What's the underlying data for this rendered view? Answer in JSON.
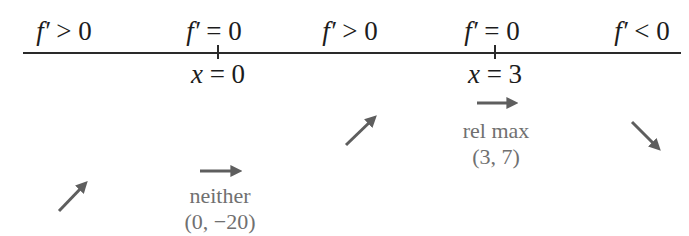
{
  "diagram": {
    "type": "sign-chart",
    "colors": {
      "text": "#1c1c1c",
      "line": "#2a2a2a",
      "arrow": "#5e5e5e",
      "annotation": "#707070"
    },
    "intervals": [
      {
        "sign_text": "f′ > 0",
        "f": "f′",
        "rel": ">",
        "val": "0",
        "arrow": "increasing"
      },
      {
        "sign_text": "f′ = 0",
        "f": "f′",
        "rel": "=",
        "val": "0",
        "arrow": "flat"
      },
      {
        "sign_text": "f′ > 0",
        "f": "f′",
        "rel": ">",
        "val": "0",
        "arrow": "increasing"
      },
      {
        "sign_text": "f′ = 0",
        "f": "f′",
        "rel": "=",
        "val": "0",
        "arrow": "flat"
      },
      {
        "sign_text": "f′ < 0",
        "f": "f′",
        "rel": "<",
        "val": "0",
        "arrow": "decreasing"
      }
    ],
    "critical_points": [
      {
        "var": "x",
        "eq": "=",
        "value": "0",
        "label": "x = 0",
        "classification": "neither",
        "point": "(0, −20)"
      },
      {
        "var": "x",
        "eq": "=",
        "value": "3",
        "label": "x = 3",
        "classification": "rel max",
        "point": "(3, 7)"
      }
    ]
  }
}
